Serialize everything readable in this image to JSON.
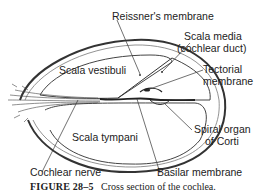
{
  "labels": {
    "reissner": "Reissner's membrane",
    "scala_media_1": "Scala media",
    "scala_media_2": "(cochlear duct)",
    "scala_vestibuli": "Scala vestibuli",
    "tectorial_1": "Tectorial",
    "tectorial_2": "membrane",
    "scala_tympani": "Scala tympani",
    "spiral_1": "Spiral organ",
    "spiral_2": "of Corti",
    "cochlear_nerve": "Cochlear nerve",
    "basilar": "Basilar membrane"
  },
  "caption": {
    "figure": "FIGURE 28–5",
    "text": "Cross section of the cochlea."
  }
}
